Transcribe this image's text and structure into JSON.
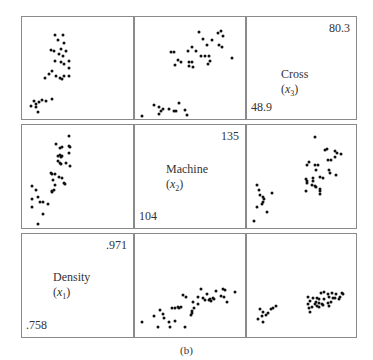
{
  "figure": {
    "caption": "(b)"
  },
  "variables": [
    {
      "name": "Density",
      "symbol": "x",
      "index": "1",
      "min": ".758",
      "max": ".971"
    },
    {
      "name": "Machine",
      "symbol": "x",
      "index": "2",
      "min": "104",
      "max": "135"
    },
    {
      "name": "Cross",
      "symbol": "x",
      "index": "3",
      "min": "48.9",
      "max": "80.3"
    }
  ],
  "chart_data": {
    "type": "scatter",
    "title": "",
    "subtitle": "(b)",
    "layout": "3x3 scatterplot matrix; diagonal panels show variable names and ranges",
    "variables": [
      "Density (x1)",
      "Machine (x2)",
      "Cross (x3)"
    ],
    "ranges": {
      "Density (x1)": [
        0.758,
        0.971
      ],
      "Machine (x2)": [
        104,
        135
      ],
      "Cross (x3)": [
        48.9,
        80.3
      ]
    },
    "grid": false,
    "legend": null,
    "panels": [
      {
        "row": 0,
        "col": 0,
        "x_var": "Density (x1)",
        "y_var": "Cross (x3)",
        "points_normalized": [
          [
            30,
            18
          ],
          [
            32,
            23
          ],
          [
            37,
            18
          ],
          [
            38,
            25
          ],
          [
            26,
            32
          ],
          [
            29,
            33
          ],
          [
            33,
            36
          ],
          [
            35,
            31
          ],
          [
            37,
            38
          ],
          [
            40,
            33
          ],
          [
            30,
            43
          ],
          [
            35,
            44
          ],
          [
            38,
            46
          ],
          [
            42,
            43
          ],
          [
            42,
            50
          ],
          [
            24,
            56
          ],
          [
            27,
            53
          ],
          [
            21,
            60
          ],
          [
            31,
            58
          ],
          [
            34,
            60
          ],
          [
            38,
            58
          ],
          [
            36,
            61
          ],
          [
            42,
            58
          ],
          [
            11,
            82
          ],
          [
            13,
            85
          ],
          [
            15,
            83
          ],
          [
            18,
            81
          ],
          [
            22,
            82
          ],
          [
            27,
            80
          ],
          [
            8,
            87
          ],
          [
            13,
            88
          ],
          [
            14,
            93
          ]
        ]
      },
      {
        "row": 0,
        "col": 1,
        "x_var": "Machine (x2)",
        "y_var": "Cross (x3)",
        "points_normalized": [
          [
            58,
            15
          ],
          [
            62,
            22
          ],
          [
            65,
            27
          ],
          [
            70,
            23
          ],
          [
            75,
            16
          ],
          [
            78,
            14
          ],
          [
            80,
            19
          ],
          [
            76,
            27
          ],
          [
            79,
            29
          ],
          [
            52,
            29
          ],
          [
            33,
            34
          ],
          [
            35,
            34
          ],
          [
            48,
            33
          ],
          [
            55,
            33
          ],
          [
            60,
            38
          ],
          [
            64,
            38
          ],
          [
            67,
            38
          ],
          [
            68,
            43
          ],
          [
            66,
            46
          ],
          [
            88,
            40
          ],
          [
            39,
            42
          ],
          [
            42,
            44
          ],
          [
            49,
            44
          ],
          [
            52,
            44
          ],
          [
            36,
            47
          ],
          [
            49,
            48
          ],
          [
            53,
            49
          ],
          [
            40,
            84
          ],
          [
            17,
            86
          ],
          [
            22,
            88
          ],
          [
            25,
            90
          ],
          [
            31,
            90
          ],
          [
            35,
            92
          ],
          [
            37,
            92
          ],
          [
            45,
            91
          ],
          [
            24,
            92
          ],
          [
            22,
            95
          ],
          [
            47,
            96
          ],
          [
            6,
            97
          ]
        ]
      },
      {
        "row": 0,
        "col": 2,
        "diagonal": "Cross (x3)",
        "max": 80.3,
        "min": 48.9
      },
      {
        "row": 1,
        "col": 0,
        "x_var": "Density (x1)",
        "y_var": "Machine (x2)",
        "points_normalized": [
          [
            42,
            11
          ],
          [
            31,
            18
          ],
          [
            34,
            22
          ],
          [
            36,
            21
          ],
          [
            42,
            20
          ],
          [
            43,
            21
          ],
          [
            42,
            27
          ],
          [
            32,
            30
          ],
          [
            34,
            29
          ],
          [
            35,
            31
          ],
          [
            36,
            30
          ],
          [
            32,
            35
          ],
          [
            34,
            37
          ],
          [
            35,
            38
          ],
          [
            40,
            37
          ],
          [
            43,
            40
          ],
          [
            26,
            47
          ],
          [
            27,
            48
          ],
          [
            30,
            48
          ],
          [
            33,
            50
          ],
          [
            28,
            53
          ],
          [
            36,
            51
          ],
          [
            38,
            56
          ],
          [
            39,
            57
          ],
          [
            9,
            59
          ],
          [
            30,
            58
          ],
          [
            29,
            63
          ],
          [
            27,
            64
          ],
          [
            27,
            65
          ],
          [
            13,
            63
          ],
          [
            14,
            70
          ],
          [
            9,
            72
          ],
          [
            16,
            75
          ],
          [
            19,
            75
          ],
          [
            23,
            77
          ],
          [
            9,
            80
          ],
          [
            19,
            86
          ],
          [
            14,
            96
          ]
        ]
      },
      {
        "row": 1,
        "col": 1,
        "diagonal": "Machine (x2)",
        "max": 135,
        "min": 104
      },
      {
        "row": 1,
        "col": 2,
        "x_var": "Cross (x3)",
        "y_var": "Machine (x2)",
        "points_normalized": [
          [
            62,
            12
          ],
          [
            73,
            23
          ],
          [
            72,
            24
          ],
          [
            81,
            25
          ],
          [
            83,
            27
          ],
          [
            86,
            28
          ],
          [
            81,
            31
          ],
          [
            74,
            34
          ],
          [
            77,
            34
          ],
          [
            57,
            36
          ],
          [
            55,
            39
          ],
          [
            62,
            39
          ],
          [
            65,
            39
          ],
          [
            63,
            44
          ],
          [
            75,
            44
          ],
          [
            76,
            47
          ],
          [
            82,
            49
          ],
          [
            67,
            50
          ],
          [
            70,
            51
          ],
          [
            54,
            52
          ],
          [
            55,
            54
          ],
          [
            61,
            51
          ],
          [
            61,
            54
          ],
          [
            55,
            56
          ],
          [
            60,
            58
          ],
          [
            62,
            59
          ],
          [
            63,
            60
          ],
          [
            67,
            62
          ],
          [
            54,
            64
          ],
          [
            67,
            64
          ],
          [
            67,
            67
          ],
          [
            9,
            58
          ],
          [
            11,
            63
          ],
          [
            12,
            68
          ],
          [
            15,
            70
          ],
          [
            23,
            66
          ],
          [
            16,
            72
          ],
          [
            15,
            75
          ],
          [
            14,
            77
          ],
          [
            9,
            80
          ],
          [
            18,
            84
          ],
          [
            6,
            93
          ]
        ]
      },
      {
        "row": 2,
        "col": 0,
        "diagonal": "Density (x1)",
        "max": 0.971,
        "min": 0.758
      },
      {
        "row": 2,
        "col": 1,
        "x_var": "Machine (x2)",
        "y_var": "Density (x1)",
        "points_normalized": [
          [
            60,
            53
          ],
          [
            65,
            58
          ],
          [
            74,
            55
          ],
          [
            80,
            53
          ],
          [
            82,
            54
          ],
          [
            91,
            56
          ],
          [
            78,
            60
          ],
          [
            81,
            61
          ],
          [
            71,
            62
          ],
          [
            62,
            62
          ],
          [
            64,
            64
          ],
          [
            67,
            64
          ],
          [
            68,
            63
          ],
          [
            69,
            65
          ],
          [
            72,
            63
          ],
          [
            57,
            61
          ],
          [
            44,
            59
          ],
          [
            46,
            61
          ],
          [
            53,
            66
          ],
          [
            57,
            68
          ],
          [
            54,
            72
          ],
          [
            52,
            75
          ],
          [
            52,
            77
          ],
          [
            51,
            79
          ],
          [
            84,
            66
          ],
          [
            42,
            71
          ],
          [
            39,
            71
          ],
          [
            36,
            72
          ],
          [
            40,
            72
          ],
          [
            34,
            72
          ],
          [
            23,
            74
          ],
          [
            25,
            78
          ],
          [
            26,
            82
          ],
          [
            31,
            85
          ],
          [
            36,
            84
          ],
          [
            17,
            80
          ],
          [
            6,
            85
          ],
          [
            21,
            90
          ],
          [
            32,
            90
          ],
          [
            45,
            90
          ]
        ]
      },
      {
        "row": 2,
        "col": 2,
        "x_var": "Cross (x3)",
        "y_var": "Density (x1)",
        "points_normalized": [
          [
            68,
            57
          ],
          [
            71,
            56
          ],
          [
            74,
            58
          ],
          [
            78,
            57
          ],
          [
            82,
            58
          ],
          [
            87,
            57
          ],
          [
            88,
            58
          ],
          [
            56,
            61
          ],
          [
            61,
            62
          ],
          [
            64,
            62
          ],
          [
            66,
            63
          ],
          [
            71,
            63
          ],
          [
            75,
            61
          ],
          [
            79,
            62
          ],
          [
            81,
            62
          ],
          [
            85,
            61
          ],
          [
            58,
            65
          ],
          [
            63,
            66
          ],
          [
            62,
            68
          ],
          [
            66,
            67
          ],
          [
            69,
            68
          ],
          [
            74,
            67
          ],
          [
            77,
            66
          ],
          [
            84,
            63
          ],
          [
            56,
            68
          ],
          [
            57,
            72
          ],
          [
            60,
            71
          ],
          [
            64,
            70
          ],
          [
            66,
            71
          ],
          [
            70,
            69
          ],
          [
            75,
            70
          ],
          [
            58,
            76
          ],
          [
            12,
            73
          ],
          [
            15,
            76
          ],
          [
            17,
            79
          ],
          [
            19,
            77
          ],
          [
            14,
            80
          ],
          [
            22,
            73
          ],
          [
            24,
            72
          ],
          [
            27,
            70
          ],
          [
            10,
            83
          ],
          [
            15,
            85
          ]
        ]
      }
    ]
  }
}
